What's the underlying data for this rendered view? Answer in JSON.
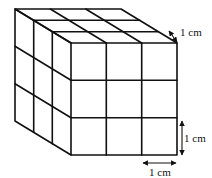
{
  "diagram": {
    "type": "cube-of-unit-cubes",
    "grid": 3,
    "colors": {
      "stroke": "#111111",
      "background": "#ffffff"
    },
    "labels": {
      "depth": "1 cm",
      "height": "1 cm",
      "width": "1 cm"
    }
  }
}
